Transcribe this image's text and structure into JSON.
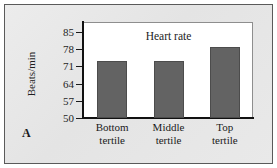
{
  "panel": {
    "label": "A"
  },
  "chart_data": {
    "type": "bar",
    "title": "Heart rate",
    "xlabel": "",
    "ylabel": "Beats/min",
    "categories": [
      "Bottom tertile",
      "Middle tertile",
      "Top tertile"
    ],
    "category_lines": [
      [
        "Bottom",
        "tertile"
      ],
      [
        "Middle",
        "tertile"
      ],
      [
        "Top",
        "tertile"
      ]
    ],
    "values": [
      73.2,
      73.2,
      78.7
    ],
    "ylim": [
      50,
      89
    ],
    "yticks": [
      50,
      57,
      64,
      71,
      78,
      85
    ],
    "ytick_labels": [
      "50",
      "57",
      "64",
      "71",
      "78",
      "85"
    ],
    "grid": false,
    "legend": false,
    "bar_color": "#636363",
    "bar_edge_color": "#4c4c4c",
    "plot_background": "#ffffff",
    "panel_background": "#e8e8e8",
    "axis_color": "#111111"
  }
}
